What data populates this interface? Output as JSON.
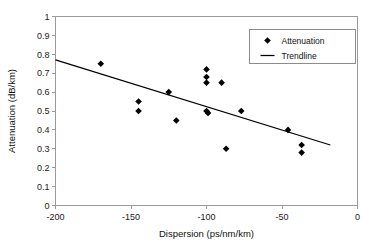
{
  "chart_data": {
    "type": "scatter",
    "title": "",
    "xlabel": "Dispersion (ps/nm/km)",
    "ylabel": "Attenuation (dB/km)",
    "xlim": [
      -200,
      0
    ],
    "ylim": [
      0,
      1
    ],
    "grid": false,
    "legend_position": "top-right",
    "xticks": [
      -200,
      -150,
      -100,
      -50,
      0
    ],
    "xtick_labels": [
      "-200",
      "-150",
      "-100",
      "-50",
      "0"
    ],
    "yticks": [
      0,
      0.1,
      0.2,
      0.3,
      0.4,
      0.5,
      0.6,
      0.7,
      0.8,
      0.9,
      1
    ],
    "ytick_labels": [
      "0",
      "0.1",
      "0.2",
      "0.3",
      "0.4",
      "0.5",
      "0.6",
      "0.7",
      "0.8",
      "0.9",
      "1"
    ],
    "series": [
      {
        "name": "Attenuation",
        "type": "scatter",
        "marker": "diamond",
        "color": "#000000",
        "points": [
          {
            "x": -170,
            "y": 0.75
          },
          {
            "x": -145,
            "y": 0.55
          },
          {
            "x": -145,
            "y": 0.5
          },
          {
            "x": -125,
            "y": 0.6
          },
          {
            "x": -120,
            "y": 0.45
          },
          {
            "x": -100,
            "y": 0.72
          },
          {
            "x": -100,
            "y": 0.68
          },
          {
            "x": -100,
            "y": 0.65
          },
          {
            "x": -100,
            "y": 0.5
          },
          {
            "x": -99,
            "y": 0.49
          },
          {
            "x": -90,
            "y": 0.65
          },
          {
            "x": -87,
            "y": 0.3
          },
          {
            "x": -77,
            "y": 0.5
          },
          {
            "x": -46,
            "y": 0.4
          },
          {
            "x": -37,
            "y": 0.32
          },
          {
            "x": -37,
            "y": 0.28
          }
        ]
      },
      {
        "name": "Trendline",
        "type": "line",
        "color": "#000000",
        "points": [
          {
            "x": -200,
            "y": 0.77
          },
          {
            "x": -18,
            "y": 0.32
          }
        ]
      }
    ]
  },
  "legend": {
    "entries": [
      {
        "label": "Attenuation",
        "marker": "diamond-marker-icon"
      },
      {
        "label": "Trendline",
        "marker": "line-marker-icon"
      }
    ]
  },
  "axes": {
    "x_title": "Dispersion (ps/nm/km)",
    "y_title": "Attenuation (dB/km)"
  }
}
